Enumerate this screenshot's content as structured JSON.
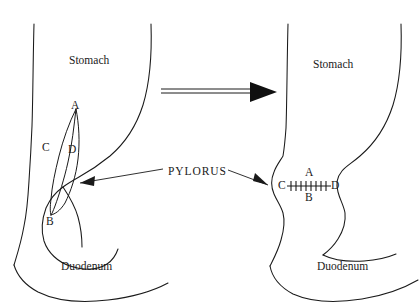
{
  "figure": {
    "background_color": "#ffffff",
    "line_color": "#1a1a1a",
    "width": 420,
    "height": 308
  },
  "center_annotation": {
    "pylorus_label": "PYLORUS",
    "left_arrow_icon": "arrow-left",
    "right_arrow_icon": "arrow-right"
  },
  "transform_arrow": {
    "icon": "double-line-arrow-right",
    "direction": "right"
  },
  "panels": [
    {
      "id": "before",
      "position": "left",
      "stomach_label": "Stomach",
      "duodenum_label": "Duodenum",
      "incision": {
        "shape": "longitudinal-lens",
        "orientation": "vertical",
        "points": [
          {
            "key": "A",
            "label": "A",
            "role": "superior-apex"
          },
          {
            "key": "B",
            "label": "B",
            "role": "inferior-apex"
          },
          {
            "key": "C",
            "label": "C",
            "role": "left-margin"
          },
          {
            "key": "D",
            "label": "D",
            "role": "right-margin"
          }
        ]
      }
    },
    {
      "id": "after",
      "position": "right",
      "stomach_label": "Stomach",
      "duodenum_label": "Duodenum",
      "closure": {
        "shape": "transverse-suture-line",
        "orientation": "horizontal",
        "stitch_count": 8,
        "points": [
          {
            "key": "C",
            "label": "C",
            "role": "left-end"
          },
          {
            "key": "D",
            "label": "D",
            "role": "right-end"
          },
          {
            "key": "A",
            "label": "A",
            "role": "above-suture"
          },
          {
            "key": "B",
            "label": "B",
            "role": "below-suture"
          }
        ]
      }
    }
  ]
}
